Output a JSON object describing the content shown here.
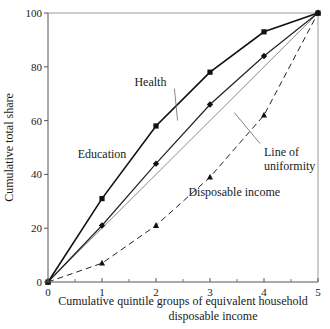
{
  "chart_data": {
    "type": "line",
    "title": "",
    "xlabel": "Cumulative quintile groups of equivalent household disposable income",
    "xlabel_lines": [
      "Cumulative quintile groups of equivalent household",
      "disposable income"
    ],
    "ylabel": "Cumulative total share",
    "x": [
      0,
      1,
      2,
      3,
      4,
      5
    ],
    "xlim": [
      0,
      5
    ],
    "ylim": [
      0,
      100
    ],
    "x_ticks": [
      0,
      1,
      2,
      3,
      4,
      5
    ],
    "x_minor_ticks": [
      0.5,
      1.5,
      2.5,
      3.5,
      4.5
    ],
    "y_ticks": [
      0,
      20,
      40,
      60,
      80,
      100
    ],
    "grid": false,
    "legend": "inline labels",
    "series": [
      {
        "name": "Education",
        "style": "solid-bold",
        "marker": "square",
        "values": [
          0,
          31,
          58,
          78,
          93,
          100
        ]
      },
      {
        "name": "Health",
        "style": "solid",
        "marker": "diamond",
        "values": [
          0,
          21,
          44,
          66,
          84,
          100
        ]
      },
      {
        "name": "Line of uniformity",
        "style": "thin-gray",
        "marker": "none",
        "values": [
          0,
          20,
          40,
          60,
          80,
          100
        ]
      },
      {
        "name": "Disposable income",
        "style": "dashed",
        "marker": "triangle",
        "values": [
          0,
          7,
          21,
          39,
          62,
          100
        ]
      }
    ],
    "annotations": [
      {
        "text": "Education",
        "x": 0.55,
        "y": 46
      },
      {
        "text": "Health",
        "x": 1.6,
        "y": 73,
        "leader_to": [
          2.4,
          60
        ]
      },
      {
        "text": "Line of uniformity",
        "lines": [
          "Line of",
          "uniformity"
        ],
        "x": 4.0,
        "y": 47,
        "leader_to": [
          3.45,
          63
        ]
      },
      {
        "text": "Disposable income",
        "x": 2.6,
        "y": 32
      }
    ]
  }
}
